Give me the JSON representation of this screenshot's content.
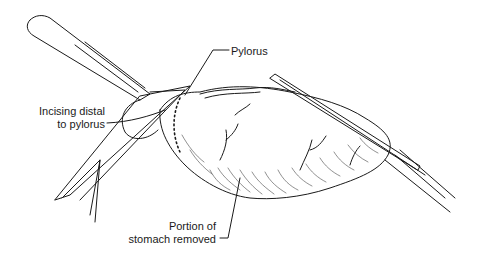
{
  "figure": {
    "labels": {
      "pylorus": "Pylorus",
      "incising_line1": "Incising distal",
      "incising_line2": "to pylorus",
      "portion_line1": "Portion of",
      "portion_line2": "stomach removed"
    },
    "colors": {
      "ink": "#1a1a1a",
      "background": "#ffffff"
    }
  }
}
